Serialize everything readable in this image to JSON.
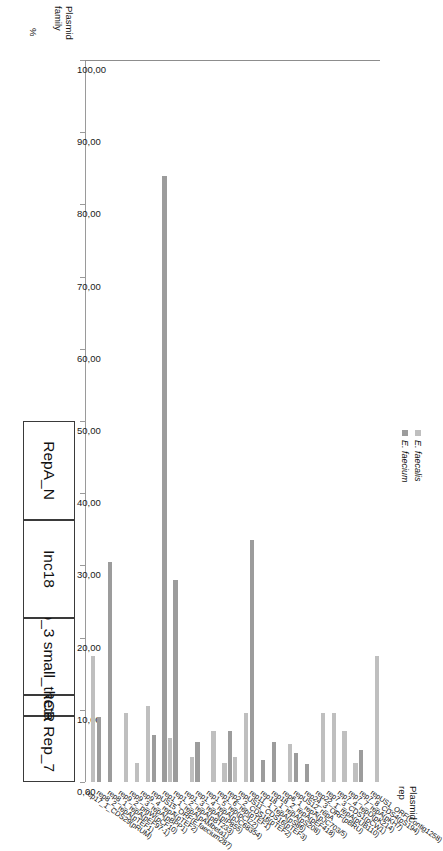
{
  "headers": {
    "family_axis_title": "Plasmid family",
    "rep_axis_title": "Plasmid rep",
    "value_axis_title": "%"
  },
  "legend": {
    "position": "top-left",
    "entries": [
      {
        "label": "E. faecalis",
        "color": "#bfbfbf"
      },
      {
        "label": "E. faecium",
        "color": "#9c9c9c"
      }
    ]
  },
  "families": [
    {
      "name": "Rep_7",
      "count": 6
    },
    {
      "name": "RCR",
      "count": 2
    },
    {
      "name": "Rep_3 small_theta",
      "count": 7
    },
    {
      "name": "Inc18",
      "count": 9
    },
    {
      "name": "RepA_N",
      "count": 9
    }
  ],
  "chart_data": {
    "type": "bar",
    "orientation": "horizontal",
    "title": "",
    "xlabel": "%",
    "ylabel": "Plasmid rep",
    "xlim": [
      0,
      100
    ],
    "xticks": [
      "0,00",
      "10,00",
      "20,00",
      "30,00",
      "40,00",
      "50,00",
      "60,00",
      "70,00",
      "80,00",
      "90,00",
      "100,00"
    ],
    "grid": false,
    "legend_position": "top-left",
    "categories": [
      "rep17_1_CDS29(pRUM)",
      "rep8_2_repA(pTEF1)",
      "rep8_1_repA(pEF97-1)",
      "rep9_2_prgW(pCF10)",
      "rep9_3_repA(pBPP1)",
      "rep9_4_repA(pTEF2)",
      "repUS15_ORF(E.faecium287)",
      "rep1_1_repA(pAMbeta1)",
      "rep1_2_repA(pBT233)",
      "rep1_3_repA(pIP855)",
      "rep1_4_repA(pJC68354)",
      "rep1_5_rep(pCIZ2)",
      "rep1_6_rep(pTEF1)",
      "rep2_2_CDS16(pTEF2)",
      "repUS11_CDS16(pTEF3)",
      "rep11_1_repA(pS86)",
      "rep18_1_repA(pS208)",
      "rep18_2_repA(pEF418)",
      "rep6_1_repA(pJC703/5)",
      "repUS12_repA",
      "rep24_3_ORF(pBRU)",
      "rep22_1_repA(pUB110)",
      "rep7_3_CDS1(pCW1)",
      "rep7_4_repD(pK214)",
      "rep7_7_repA(pKH7)",
      "rep7_8_CDS4(pS194)",
      "repUS1_ORF(Contig1258)"
    ],
    "series": [
      {
        "name": "E. faecalis",
        "color": "#bfbfbf",
        "values": [
          17.5,
          0.0,
          0.0,
          9.6,
          2.6,
          10.5,
          0.0,
          6.1,
          0.0,
          3.5,
          0.0,
          7.0,
          2.6,
          3.5,
          9.6,
          0.0,
          0.0,
          0.0,
          5.3,
          0.0,
          0.0,
          9.6,
          9.6,
          7.0,
          2.6,
          0.0,
          17.5
        ]
      },
      {
        "name": "E. faecium",
        "color": "#9c9c9c",
        "values": [
          0.0,
          9.0,
          30.5,
          0.0,
          0.0,
          0.0,
          6.5,
          84.0,
          28.0,
          0.0,
          5.5,
          0.0,
          0.0,
          7.0,
          0.0,
          33.5,
          3.0,
          5.5,
          0.0,
          4.0,
          2.5,
          0.0,
          0.0,
          0.0,
          0.0,
          4.5,
          0.0
        ]
      }
    ]
  }
}
